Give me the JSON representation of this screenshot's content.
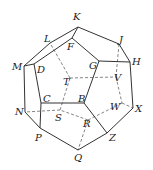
{
  "diagram": {
    "vertices": {
      "K": {
        "x": 78,
        "y": 27,
        "lx": 73,
        "ly": 20
      },
      "J": {
        "x": 119,
        "y": 44,
        "lx": 119,
        "ly": 43
      },
      "H": {
        "x": 130,
        "y": 62,
        "lx": 132,
        "ly": 65
      },
      "X": {
        "x": 133,
        "y": 108,
        "lx": 135,
        "ly": 112
      },
      "Z": {
        "x": 107,
        "y": 133,
        "lx": 109,
        "ly": 141
      },
      "Q": {
        "x": 78,
        "y": 150,
        "lx": 74,
        "ly": 161
      },
      "P": {
        "x": 40,
        "y": 128,
        "lx": 35,
        "ly": 141
      },
      "N": {
        "x": 25,
        "y": 112,
        "lx": 15,
        "ly": 115
      },
      "M": {
        "x": 24,
        "y": 66,
        "lx": 12,
        "ly": 70
      },
      "L": {
        "x": 50,
        "y": 43,
        "lx": 44,
        "ly": 42
      },
      "D": {
        "x": 34,
        "y": 64,
        "lx": 37,
        "ly": 73
      },
      "F": {
        "x": 72,
        "y": 38,
        "lx": 67,
        "ly": 50
      },
      "G": {
        "x": 99,
        "y": 61,
        "lx": 89,
        "ly": 69
      },
      "B": {
        "x": 84,
        "y": 103,
        "lx": 78,
        "ly": 102
      },
      "C": {
        "x": 41,
        "y": 103,
        "lx": 43,
        "ly": 102
      },
      "T": {
        "x": 70,
        "y": 78,
        "lx": 63,
        "ly": 85
      },
      "V": {
        "x": 116,
        "y": 77,
        "lx": 114,
        "ly": 81
      },
      "W": {
        "x": 122,
        "y": 103,
        "lx": 110,
        "ly": 110
      },
      "S": {
        "x": 60,
        "y": 110,
        "lx": 55,
        "ly": 121
      },
      "R": {
        "x": 88,
        "y": 120,
        "lx": 83,
        "ly": 127
      }
    },
    "solid_edges": [
      [
        "K",
        "J"
      ],
      [
        "J",
        "H"
      ],
      [
        "H",
        "X"
      ],
      [
        "X",
        "Z"
      ],
      [
        "Z",
        "Q"
      ],
      [
        "Q",
        "P"
      ],
      [
        "P",
        "N"
      ],
      [
        "N",
        "M"
      ],
      [
        "M",
        "L"
      ],
      [
        "L",
        "K"
      ],
      [
        "F",
        "G"
      ],
      [
        "G",
        "B"
      ],
      [
        "B",
        "C"
      ],
      [
        "C",
        "D"
      ],
      [
        "D",
        "F"
      ],
      [
        "K",
        "F"
      ],
      [
        "H",
        "G"
      ],
      [
        "Z",
        "B"
      ],
      [
        "P",
        "C"
      ],
      [
        "M",
        "D"
      ]
    ],
    "dashed_edges": [
      [
        "T",
        "V"
      ],
      [
        "V",
        "W"
      ],
      [
        "W",
        "R"
      ],
      [
        "R",
        "S"
      ],
      [
        "S",
        "T"
      ],
      [
        "T",
        "L"
      ],
      [
        "V",
        "J"
      ],
      [
        "W",
        "X"
      ],
      [
        "R",
        "Q"
      ],
      [
        "S",
        "N"
      ]
    ],
    "stroke_color": "#333333",
    "dash_color": "#666666"
  }
}
